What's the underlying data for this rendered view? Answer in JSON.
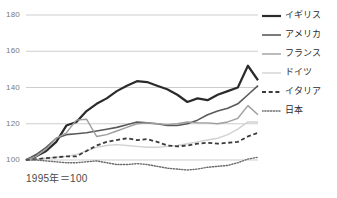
{
  "caption": "1995年＝100",
  "legend": {
    "position": "right",
    "items": [
      {
        "label": "イギリス",
        "color": "#2b2b2b",
        "style": "solid",
        "width": 2.2
      },
      {
        "label": "アメリカ",
        "color": "#5a5a5a",
        "style": "solid",
        "width": 1.6
      },
      {
        "label": "フランス",
        "color": "#9e9e9e",
        "style": "solid",
        "width": 1.4
      },
      {
        "label": "ドイツ",
        "color": "#d2d2d2",
        "style": "solid",
        "width": 1.4
      },
      {
        "label": "イタリア",
        "color": "#3a3a3a",
        "style": "dashed",
        "width": 1.8
      },
      {
        "label": "日本",
        "color": "#6b6b6b",
        "style": "dotted",
        "width": 1.4
      }
    ]
  },
  "axis": {
    "y_ticks": [
      "100",
      "120",
      "140",
      "160",
      "180"
    ],
    "y_tick_values": [
      100,
      120,
      140,
      160,
      180
    ],
    "grid": true
  },
  "chart_data": {
    "type": "line",
    "title": "",
    "subtitle": "",
    "xlabel": "",
    "ylabel": "",
    "annotations": [
      "1995年＝100"
    ],
    "grid": true,
    "legend_position": "right",
    "ylim": [
      88,
      184
    ],
    "xlim": [
      1995,
      2018
    ],
    "x": [
      1995,
      1996,
      1997,
      1998,
      1999,
      2000,
      2001,
      2002,
      2003,
      2004,
      2005,
      2006,
      2007,
      2008,
      2009,
      2010,
      2011,
      2012,
      2013,
      2014,
      2015,
      2016,
      2017,
      2018
    ],
    "categories": [
      "1995",
      "1996",
      "1997",
      "1998",
      "1999",
      "2000",
      "2001",
      "2002",
      "2003",
      "2004",
      "2005",
      "2006",
      "2007",
      "2008",
      "2009",
      "2010",
      "2011",
      "2012",
      "2013",
      "2014",
      "2015",
      "2016",
      "2017",
      "2018"
    ],
    "series": [
      {
        "name": "イギリス",
        "color": "#2b2b2b",
        "style": "solid",
        "values": [
          100,
          102,
          105,
          110,
          119,
          121,
          127,
          131,
          134,
          138,
          141,
          143.5,
          143,
          141,
          139,
          136,
          132,
          134,
          133,
          136,
          138,
          140,
          152,
          144
        ]
      },
      {
        "name": "アメリカ",
        "color": "#5a5a5a",
        "style": "solid",
        "values": [
          100,
          103,
          107,
          112,
          114,
          114.5,
          115,
          116,
          117,
          118,
          119.5,
          121,
          120.5,
          120,
          119,
          119,
          120,
          122,
          125,
          127,
          128.5,
          131,
          136,
          141
        ]
      },
      {
        "name": "フランス",
        "color": "#9e9e9e",
        "style": "solid",
        "values": [
          100,
          102,
          106,
          112,
          115,
          122,
          122.5,
          113,
          114,
          116,
          118,
          120,
          120.5,
          120,
          119.5,
          120,
          121,
          120.5,
          120.5,
          120,
          121,
          123,
          130,
          125
        ]
      },
      {
        "name": "ドイツ",
        "color": "#d2d2d2",
        "style": "solid",
        "values": [
          100,
          100.5,
          101,
          101.5,
          102,
          103,
          105,
          107,
          108,
          108.5,
          108,
          107.5,
          107,
          107,
          107.5,
          108,
          109,
          110,
          111,
          112,
          114,
          117,
          121,
          121
        ]
      },
      {
        "name": "イタリア",
        "color": "#3a3a3a",
        "style": "dashed",
        "values": [
          100,
          100.5,
          101,
          101.5,
          102,
          102,
          105,
          108,
          110,
          111,
          112,
          111,
          111.5,
          110,
          108,
          107.5,
          108,
          109,
          109.5,
          109,
          109.5,
          110,
          113,
          115
        ]
      },
      {
        "name": "日本",
        "color": "#6b6b6b",
        "style": "dotted",
        "values": [
          100,
          100,
          99.5,
          99,
          98.5,
          98.5,
          99,
          99.5,
          98.5,
          97.5,
          97.5,
          98,
          97.5,
          96.5,
          95.5,
          95,
          94.5,
          95,
          96,
          96.5,
          97,
          98.5,
          100.5,
          101.5
        ]
      }
    ]
  }
}
